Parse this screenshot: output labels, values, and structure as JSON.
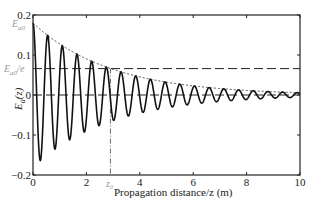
{
  "chart_data": {
    "type": "line",
    "title": "",
    "xlabel": "Propagation distance/z (m)",
    "ylabel": "E_a(z)",
    "xlim": [
      0,
      10
    ],
    "ylim": [
      -0.2,
      0.2
    ],
    "x_ticks": [
      0,
      2,
      4,
      6,
      8,
      10
    ],
    "x_tick_labels": [
      "0",
      "2",
      "4",
      "6",
      "8",
      "10"
    ],
    "y_ticks": [
      -0.2,
      -0.1,
      0,
      0.1,
      0.2
    ],
    "y_tick_labels": [
      "-0.2",
      "-0.1",
      "0",
      "0.1",
      "0.2"
    ],
    "grid": false,
    "legend": null,
    "series": [
      {
        "name": "E_a(z) oscillation",
        "style": "solid",
        "formula": "0.18*exp(-z/2.9)*cos(2*pi*z/0.55)",
        "amplitude_at_0": 0.18,
        "decay_length": 2.9,
        "period": 0.55
      },
      {
        "name": "envelope",
        "style": "dotted",
        "formula": "0.18*exp(-z/2.9)"
      },
      {
        "name": "E_a0/e level",
        "style": "dashed",
        "y": 0.066
      },
      {
        "name": "zero line",
        "style": "dashed",
        "y": 0
      },
      {
        "name": "z0 marker",
        "style": "dashdot",
        "x": 2.9
      }
    ],
    "annotations": [
      {
        "text": "E_a0",
        "at_y": 0.18,
        "position": "left-axis"
      },
      {
        "text": "E_a0/e",
        "at_y": 0.066,
        "position": "left-axis"
      },
      {
        "text": "z_0",
        "at_x": 2.9,
        "position": "below-axis"
      }
    ]
  },
  "labels": {
    "xlabel": "Propagation distance/z (m)",
    "ylabel_main": "E",
    "ylabel_sub": "a",
    "ylabel_arg": "(z)",
    "ea0_main": "E",
    "ea0_sub": "a0",
    "ea0e_main": "E",
    "ea0e_sub": "a0",
    "ea0e_tail": "/e",
    "z0_main": "z",
    "z0_sub": "0"
  }
}
